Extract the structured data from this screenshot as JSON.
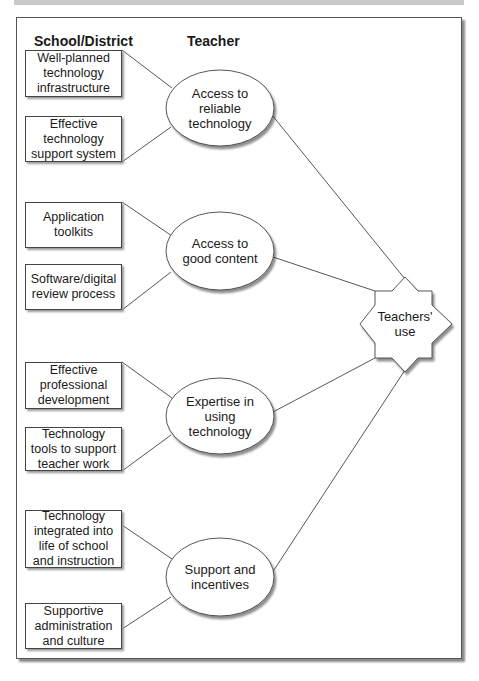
{
  "headers": {
    "left": "School/District",
    "right": "Teacher"
  },
  "factors": [
    {
      "label": "Access to reliable technology",
      "lines": [
        "Access to",
        "reliable",
        "technology"
      ],
      "inputs": [
        "Well-planned technology infrastructure",
        "Effective technology support system"
      ]
    },
    {
      "label": "Access to good content",
      "lines": [
        "Access to",
        "good content"
      ],
      "inputs": [
        "Application toolkits",
        "Software/digital review process"
      ]
    },
    {
      "label": "Expertise in using technology",
      "lines": [
        "Expertise in",
        "using",
        "technology"
      ],
      "inputs": [
        "Effective professional development",
        "Technology tools to support teacher work"
      ]
    },
    {
      "label": "Support and incentives",
      "lines": [
        "Support and",
        "incentives"
      ],
      "inputs": [
        "Technology integrated into life of school and instruction",
        "Supportive administration and culture"
      ]
    }
  ],
  "outcome": {
    "label": "Teachers' use",
    "lines": [
      "Teachers'",
      "use"
    ]
  },
  "boxes": {
    "b0": "Well-planned technology infrastructure",
    "b1": "Effective technology support system",
    "b2": "Application toolkits",
    "b3": "Software/digital review process",
    "b4": "Effective professional development",
    "b5": "Technology tools to support teacher work",
    "b6": "Technology integrated into life of school and instruction",
    "b7": "Supportive administration and culture"
  },
  "ellipses": {
    "e0": "Access to reliable technology",
    "e1": "Access to good content",
    "e2": "Expertise in using technology",
    "e3": "Support and incentives"
  },
  "colors": {
    "line": "#444444",
    "shadow": "#9a9a9a",
    "top_band": "#c9c9c9"
  }
}
